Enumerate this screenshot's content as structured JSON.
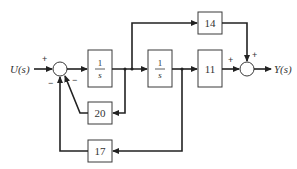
{
  "diagram": {
    "type": "block-diagram",
    "input": {
      "label": "U(s)"
    },
    "output": {
      "label": "Y(s)"
    },
    "blocks": [
      {
        "id": "integrator1",
        "numerator": "1",
        "denominator": "s"
      },
      {
        "id": "integrator2",
        "numerator": "1",
        "denominator": "s"
      },
      {
        "id": "gain11",
        "label": "11"
      },
      {
        "id": "gain14",
        "label": "14"
      },
      {
        "id": "gain20",
        "label": "20"
      },
      {
        "id": "gain17",
        "label": "17"
      }
    ],
    "summing_junctions": [
      {
        "id": "sum1",
        "signs": {
          "input": "+",
          "fb20": "−",
          "fb17": "−"
        }
      },
      {
        "id": "sum2",
        "signs": {
          "from11": "+",
          "from14": "+"
        }
      }
    ],
    "connections": [
      "U(s) → sum1 (+)",
      "sum1 → 1/s (integrator1)",
      "integrator1 → integrator2",
      "integrator1 output → 20 → sum1 (−)",
      "integrator1 output → 14 → sum2 (+)",
      "integrator2 → 11 → sum2 (+)",
      "integrator2 output → 17 → sum1 (−)",
      "sum2 → Y(s)"
    ]
  }
}
